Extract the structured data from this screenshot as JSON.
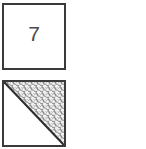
{
  "figure": {
    "background_color": "#ffffff",
    "width": 146,
    "height": 149,
    "cells": [
      {
        "id": "numbered-cell",
        "type": "plain-square",
        "label": "7",
        "border_color": "#3a3a3a",
        "fill_color": "#ffffff",
        "text_color": "#4a4a4a"
      },
      {
        "id": "shaded-cell",
        "type": "diagonal-split-square",
        "label": "",
        "border_color": "#3a3a3a",
        "fill_color": "#ffffff",
        "diagonal": "top-left-to-bottom-right",
        "shaded_half": "upper-right",
        "shaded_fill": "stipple-dots",
        "stipple_background": "#8e8e8e",
        "stipple_dot_color": "#f2f2f2",
        "diagonal_line_color": "#2e2e2e"
      }
    ]
  }
}
